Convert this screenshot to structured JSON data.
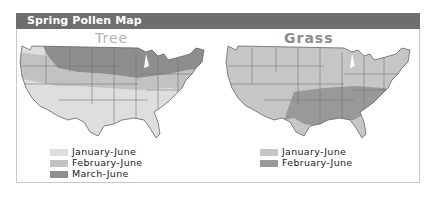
{
  "header": {
    "title": "Spring Pollen Map",
    "bar_color": "#6e6e6e"
  },
  "maps": [
    {
      "title": "Tree",
      "legend": [
        {
          "label": "January-June",
          "color": "#dedede"
        },
        {
          "label": "February-June",
          "color": "#c2c2c2"
        },
        {
          "label": "March-June",
          "color": "#8e8e8e"
        }
      ]
    },
    {
      "title": "Grass",
      "legend": [
        {
          "label": "January-June",
          "color": "#c6c6c6"
        },
        {
          "label": "February-June",
          "color": "#999999"
        }
      ]
    }
  ]
}
